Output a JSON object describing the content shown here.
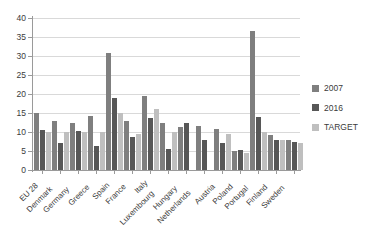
{
  "chart_data": {
    "type": "bar",
    "title": "",
    "subtitle": "",
    "xlabel": "",
    "ylabel": "",
    "ylim": [
      0,
      40
    ],
    "yticks": [
      0,
      5,
      10,
      15,
      20,
      25,
      30,
      35,
      40
    ],
    "grid": true,
    "legend_position": "right",
    "categories": [
      "EU 28",
      "Denmark",
      "Germany",
      "Greece",
      "Spain",
      "France",
      "Italy",
      "Luxembourg",
      "Hungary",
      "Netherlands",
      "Austria",
      "Poland",
      "Portugal",
      "Finland",
      "Sweden"
    ],
    "series": [
      {
        "name": "2007",
        "color": "#7f7f7f",
        "values": [
          15.0,
          12.9,
          12.4,
          14.3,
          30.7,
          12.8,
          19.5,
          12.5,
          11.4,
          11.7,
          10.8,
          5.0,
          36.5,
          9.1,
          8.0
        ]
      },
      {
        "name": "2016",
        "color": "#575757",
        "values": [
          10.5,
          7.2,
          10.2,
          6.2,
          19.0,
          8.8,
          13.8,
          5.5,
          12.4,
          8.0,
          7.0,
          5.2,
          14.0,
          7.9,
          7.4
        ]
      },
      {
        "name": "TARGET",
        "color": "#bfbfbf",
        "values": [
          10.0,
          10.0,
          10.0,
          10.0,
          15.0,
          9.5,
          16.0,
          10.0,
          null,
          null,
          9.5,
          4.5,
          10.0,
          8.0,
          7.0
        ]
      }
    ]
  },
  "legend": {
    "items": [
      {
        "label": "2007"
      },
      {
        "label": "2016"
      },
      {
        "label": "TARGET"
      }
    ]
  }
}
